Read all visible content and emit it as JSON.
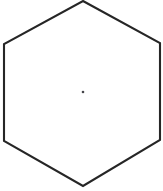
{
  "figure": {
    "name": "regular-hexagon-lines-of-symmetry",
    "background_color": "#ffffff",
    "canvas": {
      "width": 163,
      "height": 191
    },
    "shape": {
      "type": "hexagon",
      "sides": 6,
      "outline_color": "#262626",
      "outline_width": 2.1,
      "fill_color": "#ffffff",
      "center": {
        "x": 83,
        "y": 92
      },
      "vertices": [
        {
          "label": "top",
          "x": 83,
          "y": 1
        },
        {
          "label": "upper-right",
          "x": 160,
          "y": 43
        },
        {
          "label": "lower-right",
          "x": 160,
          "y": 140
        },
        {
          "label": "bottom",
          "x": 83,
          "y": 186
        },
        {
          "label": "lower-left",
          "x": 4,
          "y": 141
        },
        {
          "label": "upper-left",
          "x": 4,
          "y": 44
        }
      ],
      "edge_midpoints": [
        {
          "label": "upper-right-edge-midpoint",
          "x": 121.5,
          "y": 22
        },
        {
          "label": "right-edge-midpoint",
          "x": 160,
          "y": 91.5
        },
        {
          "label": "lower-right-edge-midpoint",
          "x": 121.5,
          "y": 163
        },
        {
          "label": "lower-left-edge-midpoint",
          "x": 43.5,
          "y": 163.5
        },
        {
          "label": "left-edge-midpoint",
          "x": 4,
          "y": 92.5
        },
        {
          "label": "upper-left-edge-midpoint",
          "x": 43.5,
          "y": 22.5
        }
      ]
    },
    "symmetry_lines": {
      "count": 6,
      "ray_count": 12,
      "color": "#45454a",
      "width": 1.15,
      "dash_pattern": "5 3.2",
      "description": "six dashed lines of symmetry: three vertex-to-vertex diagonals and three midpoint-to-midpoint lines",
      "lines": [
        {
          "name": "vertex-diagonal-top-bottom",
          "x1": 83,
          "y1": 1,
          "x2": 83,
          "y2": 186
        },
        {
          "name": "vertex-diagonal-upper-left-lower-right",
          "x1": 4,
          "y1": 44,
          "x2": 160,
          "y2": 140
        },
        {
          "name": "vertex-diagonal-upper-right-lower-left",
          "x1": 160,
          "y1": 43,
          "x2": 4,
          "y2": 141
        },
        {
          "name": "midpoint-line-upper-left-lower-right",
          "x1": 43.5,
          "y1": 22.5,
          "x2": 121.5,
          "y2": 163
        },
        {
          "name": "midpoint-line-upper-right-lower-left",
          "x1": 121.5,
          "y1": 22,
          "x2": 43.5,
          "y2": 163.5
        },
        {
          "name": "midpoint-line-left-right",
          "x1": 4,
          "y1": 92.5,
          "x2": 160,
          "y2": 91.5
        }
      ]
    }
  }
}
